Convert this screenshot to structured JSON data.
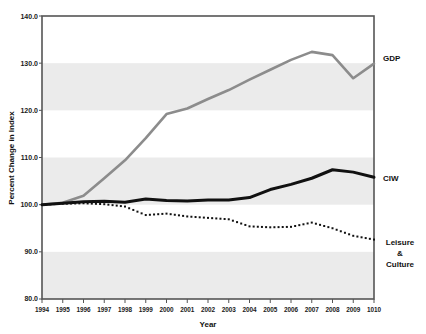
{
  "chart_data": {
    "type": "line",
    "title": "",
    "xlabel": "Year",
    "ylabel": "Percent Change in Index",
    "x": [
      "1994",
      "1995",
      "1996",
      "1997",
      "1998",
      "1999",
      "2000",
      "2001",
      "2002",
      "2003",
      "2004",
      "2005",
      "2006",
      "2007",
      "2008",
      "2009",
      "1010"
    ],
    "xlim": [
      1994,
      2010
    ],
    "ylim": [
      80.0,
      140.0
    ],
    "yticks": [
      "80.0",
      "90.0",
      "100.0",
      "110.0",
      "120.0",
      "130.0",
      "140.0"
    ],
    "grid": false,
    "banded_background": true,
    "band_ranges": [
      [
        80,
        90
      ],
      [
        100,
        110
      ],
      [
        120,
        130
      ]
    ],
    "legend_position": "right",
    "series": [
      {
        "name": "GDP",
        "label": "GDP",
        "color": "#8c8c8c",
        "style": "solid",
        "width": 2.6,
        "values": [
          100.0,
          100.4,
          101.9,
          105.6,
          109.4,
          114.1,
          119.2,
          120.4,
          122.4,
          124.3,
          126.5,
          128.6,
          130.7,
          132.4,
          131.7,
          126.8,
          129.9
        ]
      },
      {
        "name": "CIW",
        "label": "CIW",
        "color": "#111111",
        "style": "solid",
        "width": 3.0,
        "values": [
          100.0,
          100.3,
          100.6,
          100.7,
          100.5,
          101.2,
          100.9,
          100.8,
          101.0,
          101.0,
          101.5,
          103.2,
          104.3,
          105.6,
          107.4,
          106.9,
          105.8
        ]
      },
      {
        "name": "Leisure & Culture",
        "label": "Leisure\n&\nCulture",
        "color": "#111111",
        "style": "dotted",
        "width": 3.0,
        "values": [
          100.0,
          100.2,
          100.3,
          100.1,
          99.6,
          97.8,
          98.1,
          97.5,
          97.2,
          96.9,
          95.4,
          95.2,
          95.3,
          96.2,
          95.0,
          93.4,
          92.6
        ]
      }
    ]
  },
  "axes": {
    "y_title": "Percent Change in Index",
    "x_title": "Year"
  },
  "series_labels": {
    "gdp": "GDP",
    "ciw": "CIW",
    "leisure_line1": "Leisure",
    "leisure_line2": "&",
    "leisure_line3": "Culture"
  },
  "yticks": {
    "t0": "140.0",
    "t1": "130.0",
    "t2": "120.0",
    "t3": "110.0",
    "t4": "100.0",
    "t5": "90.0",
    "t6": "80.0"
  },
  "xticks": {
    "t0": "1994",
    "t1": "1995",
    "t2": "1996",
    "t3": "1997",
    "t4": "1998",
    "t5": "1999",
    "t6": "2000",
    "t7": "2001",
    "t8": "2002",
    "t9": "2003",
    "t10": "2004",
    "t11": "2005",
    "t12": "2006",
    "t13": "2007",
    "t14": "2008",
    "t15": "2009",
    "t16": "1010"
  },
  "colors": {
    "gdp_line": "#8c8c8c",
    "ciw_line": "#111111",
    "leisure_line": "#111111",
    "band": "#ebebeb",
    "axis": "#555555",
    "text": "#111111"
  }
}
